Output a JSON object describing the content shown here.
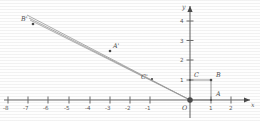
{
  "figure": {
    "kind": "coordinate-plane-dilation-diagram",
    "style": "hand-drawn pencil sketch, scanned",
    "background_color": "#fefefe",
    "ink_color": "#5a5a5a"
  },
  "axes": {
    "x_label": "x",
    "y_label": "y",
    "origin_label": "O",
    "x_ticks": [
      "-8",
      "-7",
      "-6",
      "-5",
      "-4",
      "-3",
      "-2",
      "-1",
      "1",
      "2"
    ],
    "y_ticks": [
      "1",
      "2",
      "3",
      "4"
    ],
    "x_range": [
      -8.6,
      2.8
    ],
    "y_range": [
      -0.6,
      5.2
    ],
    "x_axis_arrow": true,
    "y_axis_arrow": true
  },
  "points": [
    {
      "label": "A",
      "x": 1,
      "y": 0,
      "label_dx": 5,
      "label_dy": -4
    },
    {
      "label": "B",
      "x": 1,
      "y": 1,
      "label_dx": 5,
      "label_dy": -4
    },
    {
      "label": "C",
      "x": 0,
      "y": 1,
      "label_dx": 4,
      "label_dy": -4
    },
    {
      "label": "A'",
      "x": -3.9,
      "y": 2.45,
      "label_dx": 4,
      "label_dy": -4
    },
    {
      "label": "B'",
      "x": -7.0,
      "y": 4.3,
      "label_dx": -11,
      "label_dy": -4
    },
    {
      "label": "C'",
      "x": -1.85,
      "y": 1.05,
      "label_dx": -10,
      "label_dy": -3
    }
  ],
  "rectangle": {
    "name": "OABC",
    "vertices": [
      [
        0,
        0
      ],
      [
        1,
        0
      ],
      [
        1,
        1
      ],
      [
        0,
        1
      ]
    ]
  },
  "rays": [
    {
      "name": "ray-to-B-prime",
      "from": [
        0,
        0
      ],
      "to": [
        -7.0,
        4.3
      ]
    },
    {
      "name": "ray-to-A-prime",
      "from": [
        0,
        0
      ],
      "to": [
        -7.0,
        4.3
      ],
      "offset": true
    }
  ],
  "colors": {
    "ink": "#5a5a5a",
    "axis": "#6b6b6b",
    "shape": "#8a8a8a",
    "dot": "#4a4a4a"
  }
}
